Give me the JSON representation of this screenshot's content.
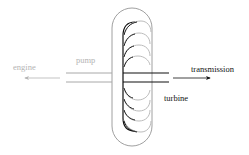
{
  "diagram": {
    "labels": {
      "engine": "engine",
      "pump": "pump",
      "transmission": "transmission",
      "turbine": "turbine"
    },
    "colors": {
      "pump_side": "#b4b4b4",
      "turbine_side": "#111111",
      "housing": "#9a9a9a",
      "background": "#ffffff"
    },
    "arrows": [
      {
        "name": "engine-arrow",
        "direction": "left"
      },
      {
        "name": "transmission-arrow",
        "direction": "right"
      }
    ]
  }
}
